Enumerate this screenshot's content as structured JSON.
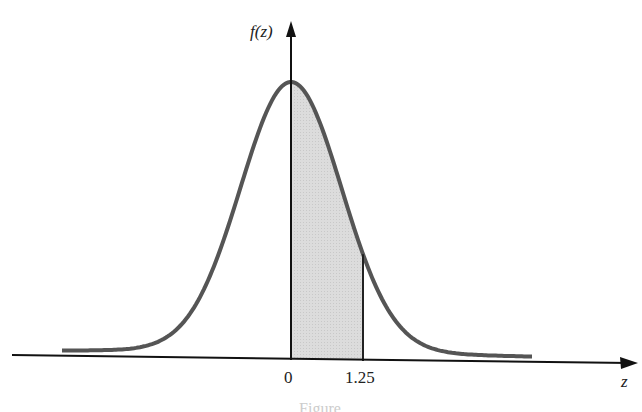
{
  "chart_data": {
    "type": "area",
    "title": "",
    "xlabel": "z",
    "ylabel": "f(z)",
    "tick_labels": [
      "0",
      "1.25"
    ],
    "ticks": [
      0,
      1.25
    ],
    "shaded_region": {
      "from": 0,
      "to": 1.25
    },
    "curve": "standard normal density",
    "grid": false,
    "legend": null
  },
  "labels": {
    "y_axis": "f(z)",
    "x_axis": "z",
    "tick_0": "0",
    "tick_1": "1.25",
    "caption": "Figure"
  },
  "colors": {
    "curve": "#555555",
    "shade": "#d9d9d9",
    "axis": "#111111"
  }
}
